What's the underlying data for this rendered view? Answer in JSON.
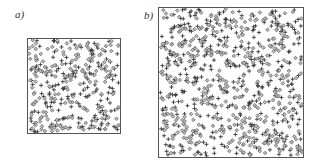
{
  "chart_data": [
    {
      "type": "scatter",
      "panel_label": "a)",
      "title": "",
      "xlabel": "",
      "ylabel": "",
      "xlim": [
        0,
        1
      ],
      "ylim": [
        0,
        1
      ],
      "grid": false,
      "legend": "none",
      "series": [
        {
          "name": "cross",
          "marker": "+",
          "color": "#3a3a3a",
          "count": 180,
          "seed": 11
        },
        {
          "name": "diamond",
          "marker": "diamond",
          "color": "#6a6a6a",
          "count": 170,
          "seed": 23
        }
      ]
    },
    {
      "type": "scatter",
      "panel_label": "b)",
      "title": "",
      "xlabel": "",
      "ylabel": "",
      "xlim": [
        0,
        1
      ],
      "ylim": [
        0,
        1
      ],
      "grid": false,
      "legend": "none",
      "series": [
        {
          "name": "cross",
          "marker": "+",
          "color": "#3a3a3a",
          "count": 420,
          "seed": 37
        },
        {
          "name": "diamond",
          "marker": "diamond",
          "color": "#6a6a6a",
          "count": 400,
          "seed": 53
        }
      ]
    }
  ]
}
